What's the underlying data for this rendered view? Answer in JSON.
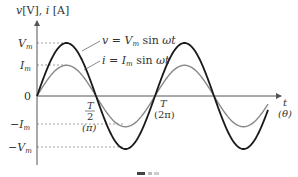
{
  "axes": {
    "y_label": "v [V], i [A]",
    "x_label": "t",
    "x_label_sub": "(θ)",
    "origin_label": "0"
  },
  "y_ticks": [
    {
      "label": "V",
      "sub": "m",
      "sign": ""
    },
    {
      "label": "I",
      "sub": "m",
      "sign": ""
    },
    {
      "label": "I",
      "sub": "m",
      "sign": "−"
    },
    {
      "label": "V",
      "sub": "m",
      "sign": "−"
    }
  ],
  "x_ticks": [
    {
      "num": "T",
      "den": "2",
      "alt": "(π)"
    },
    {
      "num": "T",
      "den": "",
      "alt": "(2π)"
    }
  ],
  "legend": {
    "voltage": "v = Vm sin ωt",
    "current": "i = Im sin ωt"
  },
  "colors": {
    "voltage": "#1a1a1a",
    "current": "#888888",
    "axis": "#555555",
    "dashed": "#777777"
  },
  "chart_data": {
    "type": "line",
    "title": "",
    "xlabel": "t (θ)",
    "ylabel": "v [V], i [A]",
    "x_ticks": [
      "0",
      "T/2 (π)",
      "T (2π)"
    ],
    "series": [
      {
        "name": "v = Vm sin ωt",
        "amplitude": "Vm",
        "periods": 2,
        "relative_amplitude": 1.0
      },
      {
        "name": "i = Im sin ωt",
        "amplitude": "Im",
        "periods": 2,
        "relative_amplitude": 0.58
      }
    ],
    "grid": false
  },
  "caption": "図"
}
